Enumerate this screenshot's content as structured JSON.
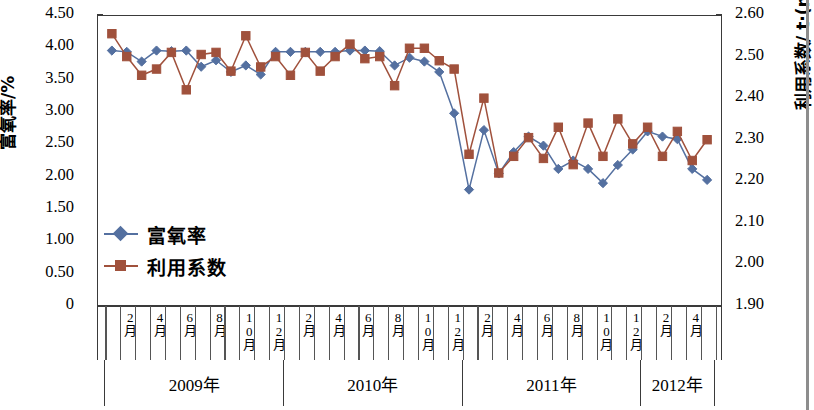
{
  "chart_data": {
    "type": "line",
    "title": "",
    "subtitle": "",
    "xlabel": "",
    "grid": false,
    "legend_position": "inside-left",
    "x": [
      "2009-01",
      "2009-02",
      "2009-03",
      "2009-04",
      "2009-05",
      "2009-06",
      "2009-07",
      "2009-08",
      "2009-09",
      "2009-10",
      "2009-11",
      "2009-12",
      "2010-01",
      "2010-02",
      "2010-03",
      "2010-04",
      "2010-05",
      "2010-06",
      "2010-07",
      "2010-08",
      "2010-09",
      "2010-10",
      "2010-11",
      "2010-12",
      "2011-01",
      "2011-02",
      "2011-03",
      "2011-04",
      "2011-05",
      "2011-06",
      "2011-07",
      "2011-08",
      "2011-09",
      "2011-10",
      "2011-11",
      "2011-12",
      "2012-01",
      "2012-02",
      "2012-03",
      "2012-04",
      "2012-05"
    ],
    "series": [
      {
        "name": "富氧率",
        "axis": "left",
        "unit": "%",
        "color": "#5470a0",
        "marker": "diamond",
        "values": [
          3.95,
          3.93,
          3.78,
          3.95,
          3.94,
          3.95,
          3.7,
          3.8,
          3.62,
          3.72,
          3.58,
          3.93,
          3.93,
          3.93,
          3.93,
          3.93,
          3.95,
          3.95,
          3.94,
          3.72,
          3.84,
          3.78,
          3.62,
          2.98,
          1.8,
          2.72,
          2.05,
          2.38,
          2.62,
          2.48,
          2.12,
          2.25,
          2.12,
          1.9,
          2.18,
          2.42,
          2.7,
          2.62,
          2.58,
          2.12,
          1.95
        ]
      },
      {
        "name": "利用系数",
        "axis": "right",
        "unit": "t·(m³·d)⁻¹",
        "color": "#a0513c",
        "marker": "square",
        "values": [
          2.555,
          2.5,
          2.455,
          2.47,
          2.51,
          2.42,
          2.505,
          2.51,
          2.465,
          2.55,
          2.475,
          2.5,
          2.455,
          2.51,
          2.465,
          2.5,
          2.53,
          2.495,
          2.5,
          2.43,
          2.52,
          2.52,
          2.49,
          2.47,
          2.265,
          2.4,
          2.22,
          2.26,
          2.305,
          2.255,
          2.33,
          2.24,
          2.34,
          2.26,
          2.35,
          2.29,
          2.33,
          2.26,
          2.32,
          2.25,
          2.3
        ]
      }
    ],
    "y_left": {
      "label": "富氧率/%",
      "min": 0,
      "max": 4.5,
      "step": 0.5,
      "ticks": [
        "0",
        "0.50",
        "1.00",
        "1.50",
        "2.00",
        "2.50",
        "3.00",
        "3.50",
        "4.00",
        "4.50"
      ]
    },
    "y_right": {
      "label_prefix": "利用系数/ t·(m",
      "label_sup1": "3",
      "label_mid": "·d)",
      "label_sup2": "-1",
      "min": 1.9,
      "max": 2.6,
      "step": 0.1,
      "ticks": [
        "1.90",
        "2.00",
        "2.10",
        "2.20",
        "2.30",
        "2.40",
        "2.50",
        "2.60"
      ]
    },
    "x_axis": {
      "month_label_template": "月",
      "labeled_months": [
        2,
        4,
        6,
        8,
        10,
        12
      ],
      "month_tick_labels": [
        "",
        "2月",
        "",
        "4月",
        "",
        "6月",
        "",
        "8月",
        "",
        "10月",
        "",
        "12月",
        "",
        "2月",
        "",
        "4月",
        "",
        "6月",
        "",
        "8月",
        "",
        "10月",
        "",
        "12月",
        "",
        "2月",
        "",
        "4月",
        "",
        "6月",
        "",
        "8月",
        "",
        "10月",
        "",
        "12月",
        "",
        "2月",
        "",
        "4月",
        ""
      ],
      "year_groups": [
        {
          "label": "2009年",
          "count": 12
        },
        {
          "label": "2010年",
          "count": 12
        },
        {
          "label": "2011年",
          "count": 12
        },
        {
          "label": "2012年",
          "count": 5
        }
      ]
    },
    "legend": [
      {
        "label": "富氧率",
        "color": "#5470a0",
        "marker": "diamond"
      },
      {
        "label": "利用系数",
        "color": "#a0513c",
        "marker": "square"
      }
    ]
  }
}
